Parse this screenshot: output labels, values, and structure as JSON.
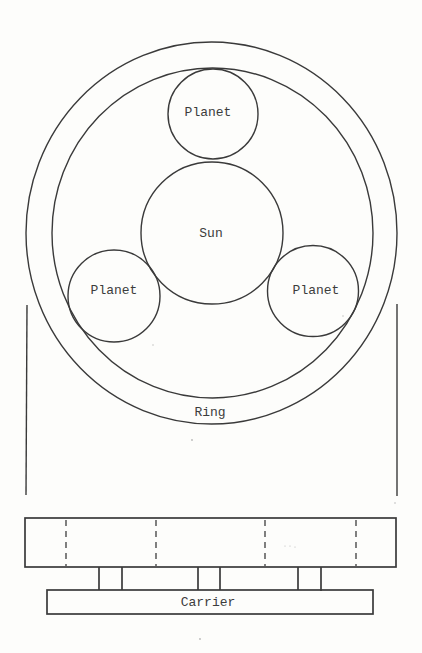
{
  "diagram": {
    "labels": {
      "planet_top": "Planet",
      "planet_left": "Planet",
      "planet_right": "Planet",
      "sun": "Sun",
      "ring": "Ring",
      "carrier": "Carrier"
    },
    "components": [
      {
        "id": "ring",
        "label": "Ring",
        "shape": "annulus",
        "center": [
          211,
          233
        ],
        "outer_radius": [
          186,
          191
        ],
        "inner_radius": [
          161,
          165
        ]
      },
      {
        "id": "sun",
        "label": "Sun",
        "shape": "circle",
        "center": [
          212,
          233
        ],
        "radius": 71
      },
      {
        "id": "planet_top",
        "label": "Planet",
        "shape": "circle",
        "center": [
          213,
          114
        ],
        "radius": 45
      },
      {
        "id": "planet_left",
        "label": "Planet",
        "shape": "circle",
        "center": [
          114,
          296
        ],
        "radius": 46
      },
      {
        "id": "planet_right",
        "label": "Planet",
        "shape": "circle",
        "center": [
          313,
          291
        ],
        "radius": 45
      },
      {
        "id": "side_view_block",
        "shape": "rect",
        "x": 25,
        "y": 518,
        "width": 371,
        "height": 49,
        "hidden_lines_x": [
          66,
          156,
          265,
          356
        ]
      },
      {
        "id": "planet_pins",
        "shape": "posts",
        "pairs_x": [
          [
            99,
            122
          ],
          [
            198,
            220
          ],
          [
            298,
            321
          ]
        ],
        "y": [
          567,
          590
        ]
      },
      {
        "id": "carrier",
        "label": "Carrier",
        "shape": "rect",
        "x": 47,
        "y": 590,
        "width": 326,
        "height": 24
      }
    ],
    "projection_lines_x": [
      27,
      397
    ],
    "colors": {
      "line": "#3a3a3a",
      "text": "#3c3c3c",
      "background": "#fdfdfb"
    }
  }
}
